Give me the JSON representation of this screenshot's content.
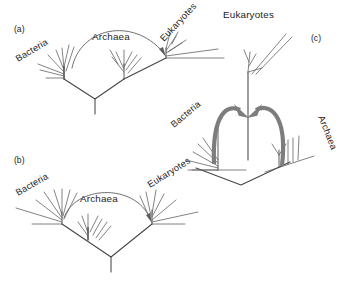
{
  "figure": {
    "background_color": "#ffffff",
    "tree_line_color": "#4a4a4a",
    "thin_arrow_color": "#6f6f6f",
    "thick_arrow_color": "#7d7d7d",
    "text_color": "#1d1d1d"
  },
  "panels": [
    {
      "key": "a",
      "label": "(a)",
      "labels": {
        "bacteria": "Bacteria",
        "archaea": "Archaea",
        "eukaryotes": "Eukaryotes"
      },
      "arrow": {
        "name": "arc-arrow-bacteria-to-eukaryotes",
        "from": "Bacteria",
        "to": "Eukaryotes",
        "style": "thin-arc"
      }
    },
    {
      "key": "b",
      "label": "(b)",
      "labels": {
        "bacteria": "Bacteria",
        "archaea": "Archaea",
        "eukaryotes": "Eukaryotes"
      },
      "arrow": {
        "name": "arc-arrow-bacteria-to-eukaryotes",
        "from": "Bacteria",
        "to": "Eukaryotes",
        "style": "thin-arc"
      }
    },
    {
      "key": "c",
      "label": "(c)",
      "labels": {
        "bacteria": "Bacteria",
        "archaea": "Archaea",
        "eukaryotes": "Eukaryotes"
      },
      "arrows": [
        {
          "name": "thick-arc-arrow-bacteria-to-eukaryotes",
          "from": "Bacteria",
          "to": "Eukaryotes",
          "style": "thick-arc"
        },
        {
          "name": "thick-arc-arrow-archaea-to-eukaryotes",
          "from": "Archaea",
          "to": "Eukaryotes",
          "style": "thick-arc"
        }
      ]
    }
  ]
}
